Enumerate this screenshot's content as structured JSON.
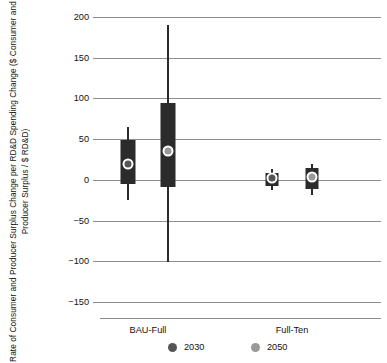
{
  "chart_data": {
    "type": "box",
    "title": "",
    "xlabel": "",
    "ylabel": "Rate of Consumer and Producer Surplus Change per RD&D Spending Change ($ Consumer and Producer Surplus / $ RD&D)",
    "ylim": [
      -150,
      200
    ],
    "yticks": [
      200,
      150,
      100,
      50,
      0,
      -50,
      -100,
      -150
    ],
    "ytick_labels": [
      "200",
      "150",
      "100",
      "50",
      "0",
      "−50",
      "−100",
      "−150"
    ],
    "grid": true,
    "categories": [
      "BAU-Full",
      "Full-Ten"
    ],
    "legend_position": "bottom",
    "series": [
      {
        "name": "2030",
        "color": "#555555",
        "boxes": [
          {
            "category": "BAU-Full",
            "whisker_low": -25,
            "q1": -5,
            "median": 20,
            "q3": 49,
            "whisker_high": 65
          },
          {
            "category": "Full-Ten",
            "whisker_low": -13,
            "q1": -8,
            "median": 2,
            "q3": 9,
            "whisker_high": 13
          }
        ]
      },
      {
        "name": "2050",
        "color": "#999999",
        "boxes": [
          {
            "category": "BAU-Full",
            "whisker_low": -101,
            "q1": -9,
            "median": 35,
            "q3": 95,
            "whisker_high": 190
          },
          {
            "category": "Full-Ten",
            "whisker_low": -18,
            "q1": -11,
            "median": 4,
            "q3": 15,
            "whisker_high": 20
          }
        ]
      }
    ]
  },
  "legend": {
    "items": [
      {
        "label": "2030",
        "color": "#555555"
      },
      {
        "label": "2050",
        "color": "#999999"
      }
    ]
  },
  "axis": {
    "y_title": "Rate of Consumer and Producer Surplus Change per RD&D Spending Change ($ Consumer and Producer Surplus / $ RD&D)"
  }
}
